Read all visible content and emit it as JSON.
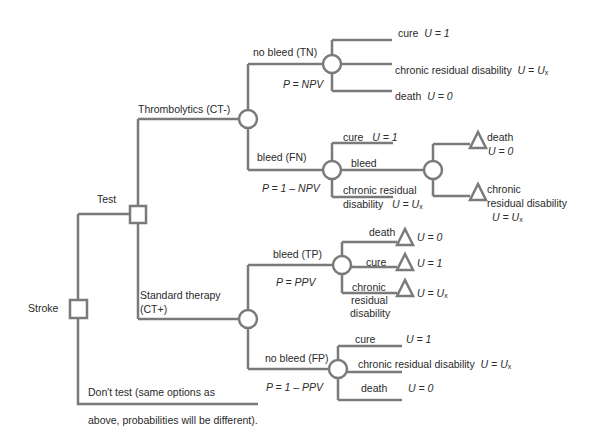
{
  "diagram": {
    "type": "decision-tree",
    "line_color": "#7a7a7a",
    "root": {
      "label": "Stroke",
      "node_type": "decision",
      "branches": [
        {
          "label": "Test",
          "node_type": "decision",
          "branches": [
            {
              "label": "Thrombolytics (CT-)",
              "node_type": "chance",
              "branches": [
                {
                  "label": "no bleed (TN)",
                  "probability": "P = NPV",
                  "node_type": "chance",
                  "outcomes": [
                    {
                      "label": "cure",
                      "utility": "U = 1"
                    },
                    {
                      "label": "chronic residual disability",
                      "utility": "U = Ux"
                    },
                    {
                      "label": "death",
                      "utility": "U = 0"
                    }
                  ]
                },
                {
                  "label": "bleed (FN)",
                  "probability": "P = 1 – NPV",
                  "node_type": "chance",
                  "outcomes": [
                    {
                      "label": "cure",
                      "utility": "U = 1"
                    },
                    {
                      "label": "bleed",
                      "node_type": "chance",
                      "outcomes": [
                        {
                          "label": "death",
                          "utility": "U = 0",
                          "node_type": "terminal"
                        },
                        {
                          "label": "chronic residual disability",
                          "utility": "U = Ux",
                          "node_type": "terminal"
                        }
                      ]
                    },
                    {
                      "label": "chronic residual disability",
                      "utility": "U = Ux"
                    }
                  ]
                }
              ]
            },
            {
              "label": "Standard therapy (CT+)",
              "node_type": "chance",
              "branches": [
                {
                  "label": "bleed (TP)",
                  "probability": "P = PPV",
                  "node_type": "chance",
                  "outcomes": [
                    {
                      "label": "death",
                      "utility": "U = 0",
                      "node_type": "terminal"
                    },
                    {
                      "label": "cure",
                      "utility": "U = 1",
                      "node_type": "terminal"
                    },
                    {
                      "label": "chronic residual disability",
                      "utility": "U = Ux",
                      "node_type": "terminal"
                    }
                  ]
                },
                {
                  "label": "no bleed (FP)",
                  "probability": "P = 1 – PPV",
                  "node_type": "chance",
                  "outcomes": [
                    {
                      "label": "cure",
                      "utility": "U = 1"
                    },
                    {
                      "label": "chronic residual disability",
                      "utility": "U = Ux"
                    },
                    {
                      "label": "death",
                      "utility": "U = 0"
                    }
                  ]
                }
              ]
            }
          ]
        },
        {
          "label": "Don't test (same options as above, probabilities will be different).",
          "label_line1": "Don't test (same options as",
          "label_line2": "above, probabilities will be different)."
        }
      ]
    }
  },
  "labels": {
    "stroke": "Stroke",
    "test": "Test",
    "thrombolytics": "Thrombolytics (CT-)",
    "standard_line1": "Standard therapy",
    "standard_line2": "(CT+)",
    "dont_test_line1": "Don't test (same options as",
    "dont_test_line2": "above, probabilities will be different).",
    "tn": "no bleed (TN)",
    "tn_p": "P = NPV",
    "tn_cure": "cure",
    "tn_cure_u": "U = 1",
    "tn_crd": "chronic residual disability",
    "tn_crd_u": "U = U",
    "tn_death": "death",
    "tn_death_u": "U = 0",
    "fn": "bleed (FN)",
    "fn_p": "P = 1 – NPV",
    "fn_cure": "cure",
    "fn_cure_u": "U = 1",
    "fn_bleed": "bleed",
    "fn_crd_line1": "chronic residual",
    "fn_crd_line2": "disability",
    "fn_crd_u": "U = U",
    "fn_bleed_death": "death",
    "fn_bleed_death_u": "U = 0",
    "fn_bleed_crd_line1": "chronic",
    "fn_bleed_crd_line2": "residual disability",
    "fn_bleed_crd_u": "U = U",
    "tp": "bleed (TP)",
    "tp_p": "P = PPV",
    "tp_death": "death",
    "tp_death_u": "U = 0",
    "tp_cure": "cure",
    "tp_cure_u": "U = 1",
    "tp_crd_line1": "chronic",
    "tp_crd_line2": "residual",
    "tp_crd_line3": "disability",
    "tp_crd_u": "U = U",
    "fp": "no bleed (FP)",
    "fp_p": "P = 1 – PPV",
    "fp_cure": "cure",
    "fp_cure_u": "U = 1",
    "fp_crd": "chronic residual disability",
    "fp_crd_u": "U = U",
    "fp_death": "death",
    "fp_death_u": "U = 0",
    "x_sub": "x"
  }
}
